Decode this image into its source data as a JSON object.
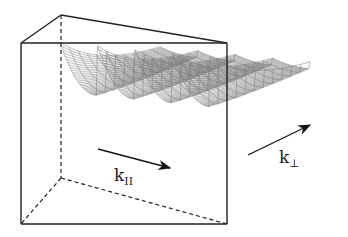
{
  "figure": {
    "labels": {
      "k_parallel": {
        "main": "k",
        "sub": "II"
      },
      "k_perp": {
        "main": "k",
        "sub": "⊥"
      }
    },
    "colors": {
      "box_line": "#222222",
      "mesh": "#7a7a7a",
      "arrow": "#111111"
    },
    "ridge_count": 4
  }
}
